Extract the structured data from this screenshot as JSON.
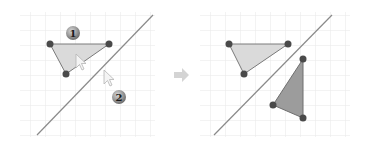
{
  "diagram": {
    "colors": {
      "grid": "#e6e6e6",
      "line": "#8a8a8a",
      "vertex": "#4a4a4a",
      "triangle_fill_light": "#d9d9d9",
      "triangle_fill_dark": "#9a9a9a",
      "triangle_stroke": "#777777",
      "badge": "#8c8c8c",
      "arrow": "#d2d2d2"
    },
    "left_panel": {
      "step_badges": [
        {
          "label": "1",
          "x": 73,
          "y": 33
        },
        {
          "label": "2",
          "x": 119,
          "y": 97
        }
      ],
      "triangle": [
        [
          50,
          44
        ],
        [
          109,
          44
        ],
        [
          66,
          74
        ]
      ],
      "mirror_line": [
        [
          37,
          135
        ],
        [
          153,
          15
        ]
      ],
      "cursors": [
        [
          80,
          56
        ],
        [
          107,
          73
        ]
      ]
    },
    "right_panel": {
      "original_triangle": [
        [
          229,
          44
        ],
        [
          288,
          44
        ],
        [
          244,
          74
        ]
      ],
      "reflected_triangle": [
        [
          303,
          59
        ],
        [
          273,
          105
        ],
        [
          303,
          118
        ]
      ],
      "mirror_line": [
        [
          214,
          135
        ],
        [
          332,
          15
        ]
      ]
    },
    "transition_arrow": {
      "direction": "right",
      "x": 181,
      "y": 75
    }
  }
}
